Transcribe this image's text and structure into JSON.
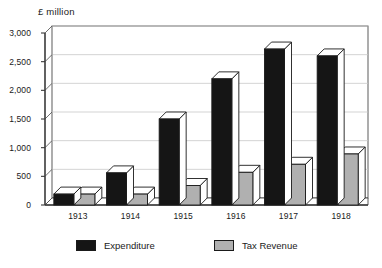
{
  "chart_data": {
    "type": "bar",
    "title": "",
    "axis_note": "£ million",
    "xlabel": "",
    "ylabel": "£ million",
    "categories": [
      "1913",
      "1914",
      "1915",
      "1916",
      "1917",
      "1918"
    ],
    "series": [
      {
        "name": "Expenditure",
        "color": "#151515",
        "values": [
          190,
          560,
          1500,
          2200,
          2720,
          2600
        ]
      },
      {
        "name": "Tax Revenue",
        "color": "#b0b0b0",
        "values": [
          190,
          190,
          340,
          570,
          710,
          890
        ]
      }
    ],
    "ylim": [
      0,
      3000
    ],
    "yticks": [
      0,
      500,
      1000,
      1500,
      2000,
      2500,
      3000
    ],
    "ytick_labels": [
      "0",
      "500",
      "1,000",
      "1,500",
      "2,000",
      "2,500",
      "3,000"
    ],
    "grid": true,
    "legend_position": "bottom",
    "style": "3d-bar"
  },
  "legend": {
    "entries": [
      {
        "label": "Expenditure"
      },
      {
        "label": "Tax Revenue"
      }
    ]
  },
  "colors": {
    "expenditure": "#151515",
    "tax_revenue": "#b0b0b0",
    "axis": "#4a4a4a",
    "grid": "#c8c8c8",
    "background": "#ffffff"
  }
}
